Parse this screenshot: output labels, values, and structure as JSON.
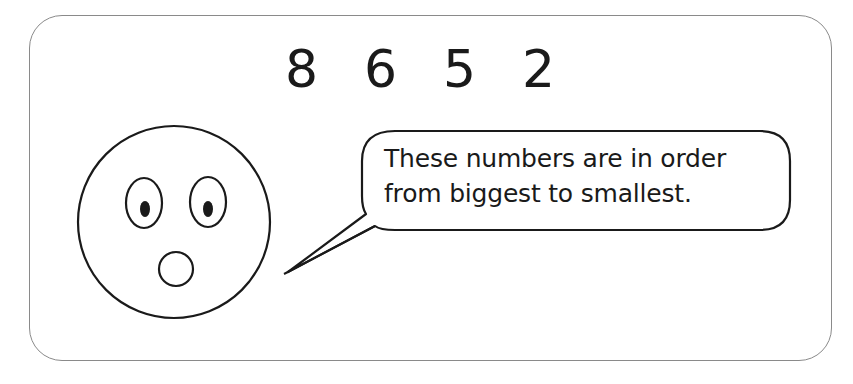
{
  "numbers": [
    "8",
    "6",
    "5",
    "2"
  ],
  "speech_bubble": {
    "lines": [
      "These numbers are in order",
      "from biggest to smallest."
    ]
  },
  "face": {
    "expression": "surprised-face-icon"
  },
  "colors": {
    "ink": "#1a1a1a",
    "card_border": "#8a8a8a",
    "background": "#ffffff"
  }
}
